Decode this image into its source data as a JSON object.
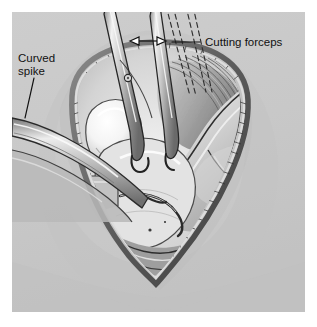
{
  "figure": {
    "type": "medical-surgical-illustration",
    "medium": "grayscale pen-and-ink / airbrush rendering",
    "canvas": {
      "width": 317,
      "height": 327
    },
    "panel": {
      "x": 12,
      "y": 12,
      "width": 293,
      "height": 300,
      "background_color": "#c9c9c9",
      "margin_color": "#ffffff"
    },
    "palette": {
      "background": "#c9c9c9",
      "ink": "#111111",
      "bone_highlight": "#fbfbfb",
      "bone_mid": "#cfcfcf",
      "bone_shadow": "#8d8d8d",
      "tissue_light": "#dcdcdc",
      "tissue_mid": "#b4b4b4",
      "tissue_dark": "#6e6e6e",
      "cavity_dark": "#2e2e2e",
      "metal_light": "#e6e6e6",
      "metal_mid": "#b0b0b0",
      "metal_dark": "#4a4a4a"
    },
    "labels": [
      {
        "id": "curved-spike",
        "text_lines": [
          "Curved",
          "spike"
        ],
        "text": "Curved spike",
        "text_x": 18,
        "text_y": 62,
        "line_height": 13,
        "anchor": "start",
        "leader": {
          "x1": 34,
          "y1": 78,
          "x2": 25,
          "y2": 118
        },
        "describes": "Long curved retractor/spike instrument entering the wound from the left"
      },
      {
        "id": "cutting-forceps",
        "text_lines": [
          "Cutting forceps"
        ],
        "text": "Cutting forceps",
        "text_x": 205,
        "text_y": 46,
        "line_height": 13,
        "anchor": "start",
        "leader": {
          "x1": 200,
          "y1": 42,
          "x2": 172,
          "y2": 42
        },
        "describes": "Scissor-action cutting forceps held in the wound, shown also in a swung-aside dashed position"
      }
    ],
    "annotations": [
      {
        "id": "motion-arrow",
        "type": "double-headed-arrow",
        "meaning": "Range of lateral swing of the cutting forceps",
        "x1": 130,
        "y1": 41,
        "x2": 166,
        "y2": 41
      },
      {
        "id": "ghost-forceps",
        "type": "dashed-outline",
        "meaning": "Alternate (swung aside) position of the cutting forceps"
      }
    ],
    "anatomy": [
      {
        "id": "wound-opening",
        "label": "Incised wound / surgical opening",
        "shape": "inverted teardrop"
      },
      {
        "id": "wound-rim",
        "label": "Cut skin and fascial edge with hatched shading"
      },
      {
        "id": "bone-head",
        "label": "Exposed bone head / cartilage highlight"
      },
      {
        "id": "condyle",
        "label": "Bone condyle and shaft sweeping to the right"
      },
      {
        "id": "muscle-fibers",
        "label": "Striated muscle fibers, fan shaped"
      },
      {
        "id": "joint-cavity",
        "label": "Dark joint cavity recess"
      }
    ],
    "instruments": [
      {
        "id": "curved-spike-instrument",
        "label": "Curved spike",
        "entry": "left edge, angled down-right"
      },
      {
        "id": "cutting-forceps-instrument",
        "label": "Cutting forceps",
        "entry": "top, two hinged blades with pivot rivet"
      }
    ]
  }
}
